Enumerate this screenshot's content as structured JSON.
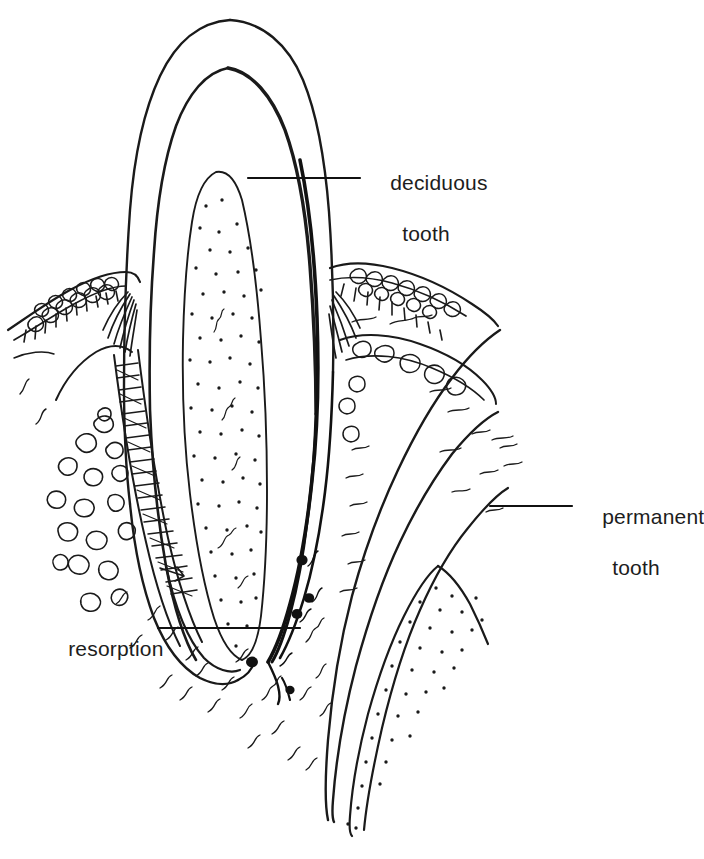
{
  "figure": {
    "background_color": "#ffffff",
    "ink_color": "#1a1a1a",
    "text_color": "#1d1d1d",
    "width": 704,
    "height": 859
  },
  "labels": {
    "deciduous": {
      "line1": "deciduous",
      "line2": "tooth"
    },
    "permanent": {
      "line1": "permanent",
      "line2": "tooth"
    },
    "resorption": {
      "line1": "resorption",
      "line2": ""
    }
  },
  "leader_lines": [
    {
      "name": "deciduous-leader",
      "x1": 248,
      "y1": 178,
      "x2": 360,
      "y2": 178
    },
    {
      "name": "permanent-leader",
      "x1": 490,
      "y1": 506,
      "x2": 572,
      "y2": 506
    },
    {
      "name": "resorption-leader",
      "x1": 158,
      "y1": 628,
      "x2": 300,
      "y2": 628
    }
  ],
  "structures": [
    {
      "name": "deciduous-tooth-enamel",
      "description": "outer enamel contour of primary incisor"
    },
    {
      "name": "deciduous-tooth-dentin",
      "description": "dentin layer of primary incisor"
    },
    {
      "name": "deciduous-tooth-pulp",
      "description": "stippled pulp chamber of primary incisor"
    },
    {
      "name": "gingiva-left",
      "description": "scalloped keratinized gingival epithelium, left"
    },
    {
      "name": "gingiva-right",
      "description": "scalloped keratinized gingival epithelium, right"
    },
    {
      "name": "periodontal-ligament",
      "description": "ladder-hatched ligament fibers along left root"
    },
    {
      "name": "alveolar-bone-trabeculae",
      "description": "marrow spaces in alveolar bone"
    },
    {
      "name": "permanent-tooth-enamel",
      "description": "outer enamel contour of developing permanent tooth"
    },
    {
      "name": "permanent-tooth-dentin",
      "description": "dentin layer of permanent tooth"
    },
    {
      "name": "permanent-tooth-pulp",
      "description": "stippled pulp of permanent tooth"
    },
    {
      "name": "resorption-lacunae",
      "description": "dark osteoclastic resorption blobs at deciduous root apex"
    }
  ]
}
